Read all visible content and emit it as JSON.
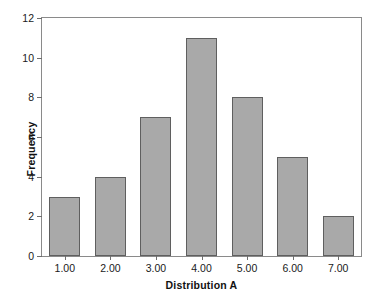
{
  "chart_data": {
    "type": "bar",
    "title": "",
    "categories": [
      "1.00",
      "2.00",
      "3.00",
      "4.00",
      "5.00",
      "6.00",
      "7.00"
    ],
    "values": [
      3,
      4,
      7,
      11,
      8,
      5,
      2
    ],
    "xlabel": "Distribution A",
    "ylabel": "Frequency",
    "ylim": [
      0,
      12
    ],
    "yticks": [
      0,
      2,
      4,
      6,
      8,
      10,
      12
    ],
    "ytick_labels": [
      "0",
      "2",
      "4",
      "6",
      "8",
      "10",
      "12"
    ],
    "grid": false,
    "legend": false,
    "bar_fill_color": "#a9a9a9",
    "bar_edge_color": "#5f5f5f",
    "frame_color": "#8a8a8a",
    "background_color": "#ffffff"
  }
}
